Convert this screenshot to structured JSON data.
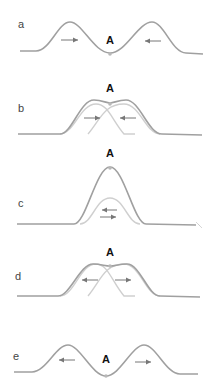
{
  "diagram": {
    "topic": "superposition of two wave pulses passing through point A",
    "colors": {
      "resultant_wave": "#a0a0a0",
      "component_pulse": "#cfcfcf",
      "arrow": "#777777",
      "point_marker": "#b8b8b8",
      "label_text": "#444444",
      "point_label_text": "#111111"
    },
    "point_label": "A",
    "panels": [
      {
        "id": "a",
        "label": "a",
        "point_label": "A",
        "arrows": [
          "right",
          "left"
        ],
        "description": "two pulses approaching A from opposite sides"
      },
      {
        "id": "b",
        "label": "b",
        "point_label": "A",
        "arrows": [
          "right",
          "left"
        ],
        "description": "pulses begin to overlap"
      },
      {
        "id": "c",
        "label": "c",
        "point_label": "A",
        "arrows": [
          "left",
          "right"
        ],
        "description": "pulses fully overlap, constructive interference at A"
      },
      {
        "id": "d",
        "label": "d",
        "point_label": "A",
        "arrows": [
          "left",
          "right"
        ],
        "description": "pulses begin to separate"
      },
      {
        "id": "e",
        "label": "e",
        "point_label": "A",
        "arrows": [
          "left",
          "right"
        ],
        "description": "pulses move away from A unchanged"
      }
    ]
  }
}
